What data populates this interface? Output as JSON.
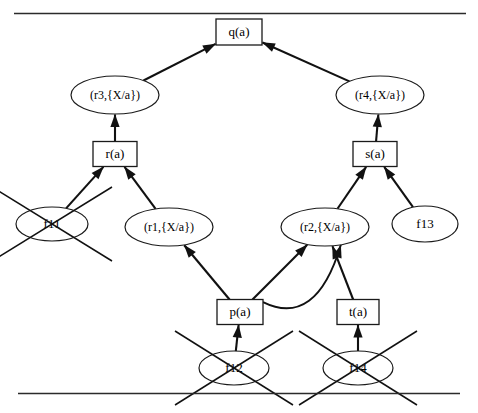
{
  "figure": {
    "type": "proof-tree-diagram",
    "title": "",
    "top_rule": true,
    "bottom_rule": true
  },
  "nodes": [
    {
      "id": "q",
      "label": "q(a)",
      "shape": "box",
      "struck": false,
      "x": 239,
      "y": 32,
      "w": 46,
      "h": 26
    },
    {
      "id": "r3",
      "label": "(r3,{X/a})",
      "shape": "ellipse",
      "struck": false,
      "x": 115,
      "y": 95,
      "w": 88,
      "h": 38
    },
    {
      "id": "r4",
      "label": "(r4,{X/a})",
      "shape": "ellipse",
      "struck": false,
      "x": 380,
      "y": 95,
      "w": 88,
      "h": 38
    },
    {
      "id": "r",
      "label": "r(a)",
      "shape": "box",
      "struck": false,
      "x": 115,
      "y": 154,
      "w": 44,
      "h": 25
    },
    {
      "id": "s",
      "label": "s(a)",
      "shape": "box",
      "struck": false,
      "x": 375,
      "y": 154,
      "w": 44,
      "h": 25
    },
    {
      "id": "f11",
      "label": "f11",
      "shape": "ellipse",
      "struck": true,
      "x": 52,
      "y": 224,
      "w": 72,
      "h": 34
    },
    {
      "id": "r1",
      "label": "(r1,{X/a})",
      "shape": "ellipse",
      "struck": false,
      "x": 169,
      "y": 227,
      "w": 88,
      "h": 38
    },
    {
      "id": "r2",
      "label": "(r2,{X/a})",
      "shape": "ellipse",
      "struck": false,
      "x": 325,
      "y": 227,
      "w": 88,
      "h": 38
    },
    {
      "id": "f13",
      "label": "f13",
      "shape": "ellipse",
      "struck": false,
      "x": 425,
      "y": 224,
      "w": 66,
      "h": 36
    },
    {
      "id": "p",
      "label": "p(a)",
      "shape": "box",
      "struck": false,
      "x": 240,
      "y": 312,
      "w": 46,
      "h": 25
    },
    {
      "id": "t",
      "label": "t(a)",
      "shape": "box",
      "struck": false,
      "x": 358,
      "y": 312,
      "w": 42,
      "h": 25
    },
    {
      "id": "f12",
      "label": "f12",
      "shape": "ellipse",
      "struck": true,
      "x": 234,
      "y": 368,
      "w": 70,
      "h": 34
    },
    {
      "id": "f14",
      "label": "f14",
      "shape": "ellipse",
      "struck": true,
      "x": 358,
      "y": 368,
      "w": 70,
      "h": 34
    }
  ],
  "edges": [
    {
      "from": "r3",
      "to": "q",
      "style": "straight"
    },
    {
      "from": "r4",
      "to": "q",
      "style": "straight"
    },
    {
      "from": "r",
      "to": "r3",
      "style": "straight"
    },
    {
      "from": "s",
      "to": "r4",
      "style": "straight"
    },
    {
      "from": "f11",
      "to": "r",
      "style": "straight"
    },
    {
      "from": "r1",
      "to": "r",
      "style": "straight"
    },
    {
      "from": "r2",
      "to": "s",
      "style": "straight"
    },
    {
      "from": "f13",
      "to": "s",
      "style": "straight"
    },
    {
      "from": "p",
      "to": "r1",
      "style": "straight"
    },
    {
      "from": "p",
      "to": "r2",
      "style": "straight"
    },
    {
      "from": "p",
      "to": "r2",
      "style": "curved"
    },
    {
      "from": "t",
      "to": "r2",
      "style": "straight"
    },
    {
      "from": "f12",
      "to": "p",
      "style": "straight"
    },
    {
      "from": "f14",
      "to": "t",
      "style": "straight"
    }
  ],
  "colors": {
    "stroke": "#111111",
    "background": "#ffffff",
    "rule": "#2b2b2b"
  }
}
